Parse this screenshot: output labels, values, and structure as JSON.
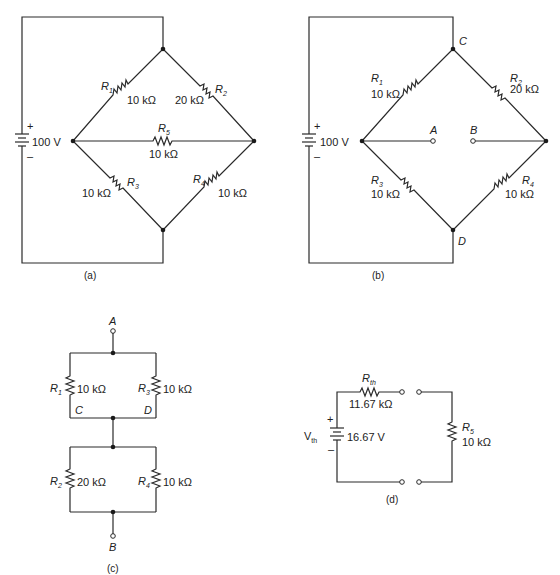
{
  "figure": {
    "panels": [
      {
        "id": "a",
        "caption": "(a)",
        "source": {
          "label": "100 V",
          "plus": "+",
          "minus": "–"
        },
        "resistors": [
          {
            "name": "R",
            "sub": "1",
            "value": "10 kΩ"
          },
          {
            "name": "R",
            "sub": "2",
            "value": "20 kΩ"
          },
          {
            "name": "R",
            "sub": "5",
            "value": "10 kΩ"
          },
          {
            "name": "R",
            "sub": "3",
            "value": "10 kΩ"
          },
          {
            "name": "R",
            "sub": "4",
            "value": "10 kΩ"
          }
        ]
      },
      {
        "id": "b",
        "caption": "(b)",
        "source": {
          "label": "100 V",
          "plus": "+",
          "minus": "–"
        },
        "nodes": {
          "top": "C",
          "bottom": "D",
          "left_terminal": "A",
          "right_terminal": "B"
        },
        "resistors": [
          {
            "name": "R",
            "sub": "1",
            "value": "10 kΩ"
          },
          {
            "name": "R",
            "sub": "2",
            "value": "20 kΩ"
          },
          {
            "name": "R",
            "sub": "3",
            "value": "10 kΩ"
          },
          {
            "name": "R",
            "sub": "4",
            "value": "10 kΩ"
          }
        ]
      },
      {
        "id": "c",
        "caption": "(c)",
        "nodes": {
          "top": "A",
          "bottom": "B",
          "mid_left": "C",
          "mid_right": "D"
        },
        "resistors": [
          {
            "name": "R",
            "sub": "1",
            "value": "10 kΩ"
          },
          {
            "name": "R",
            "sub": "3",
            "value": "10 kΩ"
          },
          {
            "name": "R",
            "sub": "2",
            "value": "20 kΩ"
          },
          {
            "name": "R",
            "sub": "4",
            "value": "10 kΩ"
          }
        ]
      },
      {
        "id": "d",
        "caption": "(d)",
        "source": {
          "name": "V",
          "sub": "th",
          "label": "16.67 V",
          "plus": "+",
          "minus": "–"
        },
        "resistors": [
          {
            "name": "R",
            "sub": "th",
            "value": "11.67 kΩ"
          },
          {
            "name": "R",
            "sub": "5",
            "value": "10 kΩ"
          }
        ]
      }
    ]
  }
}
